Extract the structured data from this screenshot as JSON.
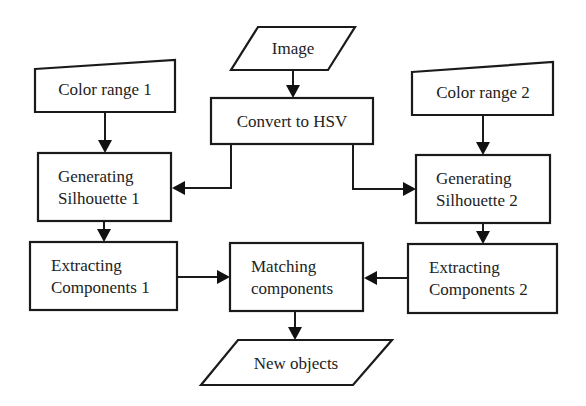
{
  "diagram": {
    "type": "flowchart",
    "nodes": {
      "image": {
        "shape": "parallelogram",
        "lines": [
          "Image"
        ]
      },
      "convert_hsv": {
        "shape": "rectangle",
        "lines": [
          "Convert to HSV"
        ]
      },
      "color_range_1": {
        "shape": "manual-input",
        "lines": [
          "Color range 1"
        ]
      },
      "color_range_2": {
        "shape": "manual-input",
        "lines": [
          "Color range 2"
        ]
      },
      "gen_silhouette_1": {
        "shape": "rectangle",
        "lines": [
          "Generating",
          "Silhouette 1"
        ]
      },
      "gen_silhouette_2": {
        "shape": "rectangle",
        "lines": [
          "Generating",
          "Silhouette 2"
        ]
      },
      "extract_1": {
        "shape": "rectangle",
        "lines": [
          "Extracting",
          "Components 1"
        ]
      },
      "extract_2": {
        "shape": "rectangle",
        "lines": [
          "Extracting",
          "Components 2"
        ]
      },
      "matching": {
        "shape": "rectangle",
        "lines": [
          "Matching",
          "components"
        ]
      },
      "new_objects": {
        "shape": "parallelogram",
        "lines": [
          "New objects"
        ]
      }
    },
    "edges": [
      {
        "from": "Image",
        "to": "Convert to HSV"
      },
      {
        "from": "Convert to HSV",
        "to": "Generating Silhouette 1"
      },
      {
        "from": "Convert to HSV",
        "to": "Generating Silhouette 2"
      },
      {
        "from": "Color range 1",
        "to": "Generating Silhouette 1"
      },
      {
        "from": "Color range 2",
        "to": "Generating Silhouette 2"
      },
      {
        "from": "Generating Silhouette 1",
        "to": "Extracting Components 1"
      },
      {
        "from": "Generating Silhouette 2",
        "to": "Extracting Components 2"
      },
      {
        "from": "Extracting Components 1",
        "to": "Matching components"
      },
      {
        "from": "Extracting Components 2",
        "to": "Matching components"
      },
      {
        "from": "Matching components",
        "to": "New objects"
      }
    ],
    "colors": {
      "stroke": "#1a1a1a",
      "fill": "#ffffff",
      "text": "#222222"
    }
  }
}
